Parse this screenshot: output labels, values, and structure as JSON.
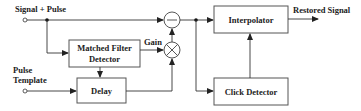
{
  "diagram": {
    "inputs": {
      "signal_pulse": "Signal + Pulse",
      "pulse_template_line1": "Pulse",
      "pulse_template_line2": "Template"
    },
    "blocks": {
      "matched_filter_line1": "Matched Filter",
      "matched_filter_line2": "Detector",
      "delay": "Delay",
      "interpolator": "Interpolator",
      "click_detector": "Click Detector"
    },
    "operators": {
      "subtract": "−",
      "multiply": "×"
    },
    "labels": {
      "gain": "Gain",
      "output": "Restored Signal"
    }
  }
}
